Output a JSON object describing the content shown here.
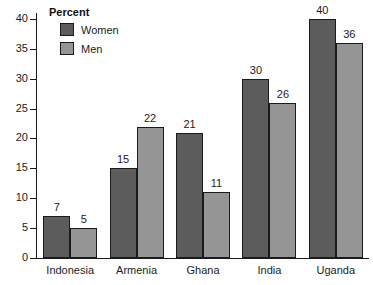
{
  "chart_data": {
    "type": "bar",
    "title": "",
    "xlabel": "",
    "ylabel": "",
    "legend_title": "Percent",
    "legend_position": "top-left",
    "grid": false,
    "ylim": [
      0,
      41
    ],
    "yticks": [
      0,
      5,
      10,
      15,
      20,
      25,
      30,
      35,
      40
    ],
    "ytick_labels": [
      "0",
      "5",
      "10",
      "15",
      "20",
      "25",
      "30",
      "35",
      "40"
    ],
    "categories": [
      "Indonesia",
      "Armenia",
      "Ghana",
      "India",
      "Uganda"
    ],
    "series": [
      {
        "name": "Women",
        "color": "#5c5c5c",
        "values": [
          7,
          15,
          21,
          30,
          40
        ],
        "value_labels": [
          "7",
          "15",
          "21",
          "30",
          "40"
        ]
      },
      {
        "name": "Men",
        "color": "#959595",
        "values": [
          5,
          22,
          11,
          26,
          36
        ],
        "value_labels": [
          "5",
          "22",
          "11",
          "26",
          "36"
        ]
      }
    ]
  }
}
